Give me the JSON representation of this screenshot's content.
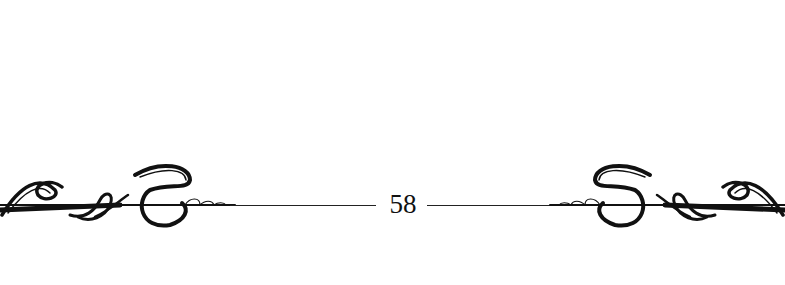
{
  "page": {
    "page_number": "58",
    "ornament": "calligraphic-flourish-divider",
    "colors": {
      "ink": "#111111",
      "background": "#ffffff"
    }
  }
}
